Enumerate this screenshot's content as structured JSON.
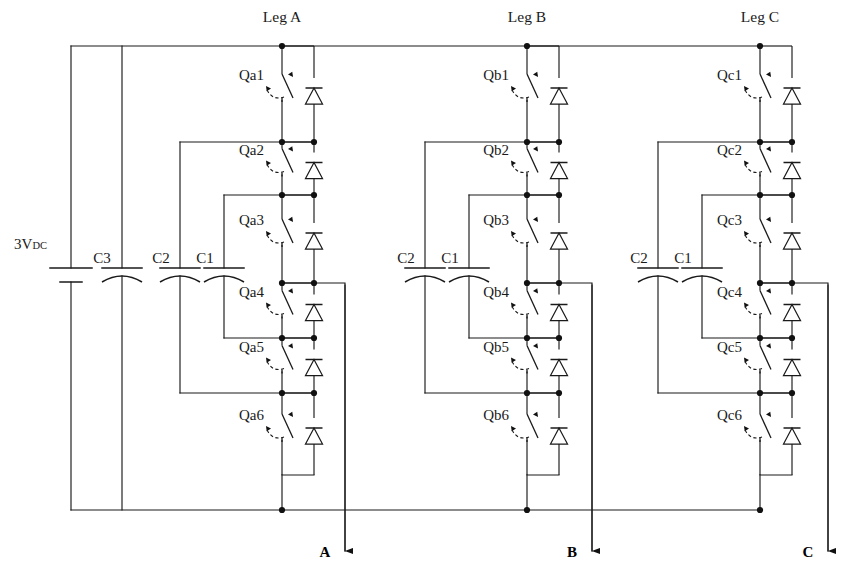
{
  "diagram": {
    "title_source": "Three-phase flying-capacitor multilevel inverter schematic",
    "source_label": "3V",
    "source_sub": "DC",
    "legs": [
      {
        "id": "a",
        "leg_label": "Leg A",
        "x": 282,
        "output_label": "A",
        "output_x": 345,
        "switches": [
          "Qa1",
          "Qa2",
          "Qa3",
          "Qa4",
          "Qa5",
          "Qa6"
        ],
        "caps": [
          {
            "name": "C2",
            "x": 180,
            "label_dx": -19
          },
          {
            "name": "C1",
            "x": 224,
            "label_dx": -19
          }
        ]
      },
      {
        "id": "b",
        "leg_label": "Leg B",
        "x": 527,
        "output_label": "B",
        "output_x": 592,
        "switches": [
          "Qb1",
          "Qb2",
          "Qb3",
          "Qb4",
          "Qb5",
          "Qb6"
        ],
        "caps": [
          {
            "name": "C2",
            "x": 425,
            "label_dx": -19
          },
          {
            "name": "C1",
            "x": 469,
            "label_dx": -19
          }
        ]
      },
      {
        "id": "c",
        "leg_label": "Leg C",
        "x": 760,
        "output_label": "C",
        "output_x": 828,
        "switches": [
          "Qc1",
          "Qc2",
          "Qc3",
          "Qc4",
          "Qc5",
          "Qc6"
        ],
        "caps": [
          {
            "name": "C2",
            "x": 658,
            "label_dx": -19
          },
          {
            "name": "C1",
            "x": 702,
            "label_dx": -19
          }
        ]
      }
    ],
    "dc_bus": {
      "source_x": 71,
      "c3": {
        "name": "C3",
        "x": 122
      },
      "top_rail_y": 46,
      "bottom_rail_y": 510
    },
    "nodes_y": [
      142,
      195,
      283,
      338,
      393
    ],
    "stroke_color": "#1a1a1a",
    "background": "#ffffff"
  }
}
